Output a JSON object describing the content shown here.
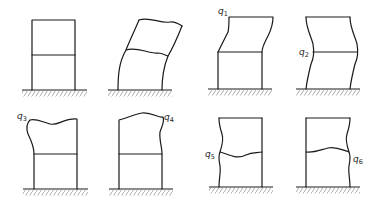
{
  "diagram": {
    "title": "",
    "colors": {
      "line": "#1a1a1a",
      "hatch": "#888888",
      "background": "#ffffff"
    },
    "frames": [
      {
        "id": "undeformed",
        "label": "",
        "label_base": "",
        "label_sub": ""
      },
      {
        "id": "sway",
        "label": "",
        "label_base": "",
        "label_sub": ""
      },
      {
        "id": "mode-q1",
        "label": "q1",
        "label_base": "q",
        "label_sub": "1"
      },
      {
        "id": "mode-q2",
        "label": "q2",
        "label_base": "q",
        "label_sub": "2"
      },
      {
        "id": "mode-q3",
        "label": "q3",
        "label_base": "q",
        "label_sub": "3"
      },
      {
        "id": "mode-q4",
        "label": "q4",
        "label_base": "q",
        "label_sub": "4"
      },
      {
        "id": "mode-q5",
        "label": "q5",
        "label_base": "q",
        "label_sub": "5"
      },
      {
        "id": "mode-q6",
        "label": "q6",
        "label_base": "q",
        "label_sub": "6"
      }
    ]
  }
}
